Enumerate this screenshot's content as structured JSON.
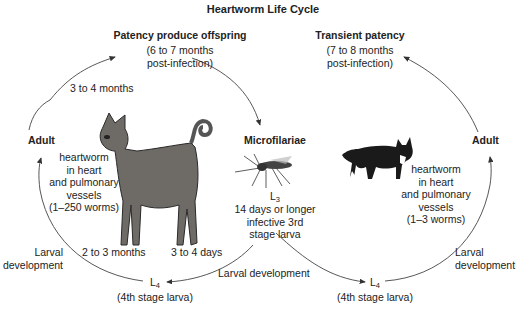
{
  "title": "Heartworm Life Cycle",
  "dog_cycle": {
    "patency_heading": "Patency produce offspring",
    "patency_time_line1": "(6 to 7 months",
    "patency_time_line2": "post-infection)",
    "adult_label": "Adult",
    "adult_to_patency_time": "3 to 4 months",
    "host_text": [
      "heartworm",
      "in heart",
      "and pulmonary",
      "vessels",
      "(1–250 worms)"
    ],
    "larval_dev_line1": "Larval",
    "larval_dev_line2": "development",
    "l4_to_adult_time": "2 to 3 months",
    "l3_to_l4_time": "3 to 4 days",
    "l4_symbol": "L",
    "l4_sub": "4",
    "l4_desc": "(4th stage larva)"
  },
  "mosquito": {
    "microfilariae_label": "Microfilariae",
    "l3_symbol": "L",
    "l3_sub": "3",
    "l3_desc": [
      "14 days or longer",
      "infective 3rd",
      "stage larva"
    ],
    "larval_development": "Larval development"
  },
  "cat_cycle": {
    "patency_heading": "Transient patency",
    "patency_time_line1": "(7 to 8 months",
    "patency_time_line2": "post-infection)",
    "adult_label": "Adult",
    "host_text": [
      "heartworm",
      "in heart",
      "and pulmonary",
      "vessels",
      "(1–3 worms)"
    ],
    "larval_dev_line1": "Larval",
    "larval_dev_line2": "development",
    "l4_symbol": "L",
    "l4_sub": "4",
    "l4_desc": "(4th stage larva)"
  },
  "images": {
    "dog": "dog-illustration",
    "mosquito": "mosquito-illustration",
    "cat": "cat-illustration"
  }
}
